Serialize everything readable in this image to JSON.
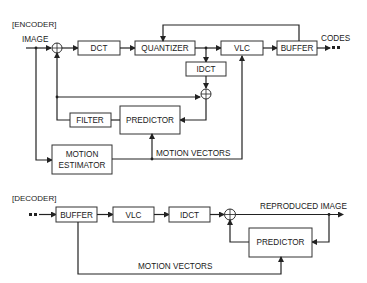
{
  "encoder": {
    "heading": "[ENCODER]",
    "input_label": "IMAGE",
    "output_label": "CODES",
    "blocks": {
      "dct": "DCT",
      "quantizer": "QUANTIZER",
      "vlc": "VLC",
      "buffer": "BUFFER",
      "idct": "IDCT",
      "filter": "FILTER",
      "predictor": "PREDICTOR",
      "motion_estimator_line1": "MOTION",
      "motion_estimator_line2": "ESTIMATOR"
    },
    "motion_vectors_label": "MOTION VECTORS"
  },
  "decoder": {
    "heading": "[DECODER]",
    "output_label": "REPRODUCED IMAGE",
    "blocks": {
      "buffer": "BUFFER",
      "vlc": "VLC",
      "idct": "IDCT",
      "predictor": "PREDICTOR"
    },
    "motion_vectors_label": "MOTION VECTORS"
  }
}
